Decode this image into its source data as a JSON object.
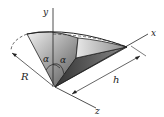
{
  "diagram": {
    "labels": {
      "y_axis": "y",
      "x_axis": "x",
      "z_axis": "z",
      "radius": "R",
      "height": "h",
      "alpha_left": "α",
      "alpha_right": "α"
    },
    "colors": {
      "stroke": "#222222",
      "shade_dark": "#444444",
      "shade_light": "#e6e6e6",
      "background": "#ffffff"
    }
  }
}
